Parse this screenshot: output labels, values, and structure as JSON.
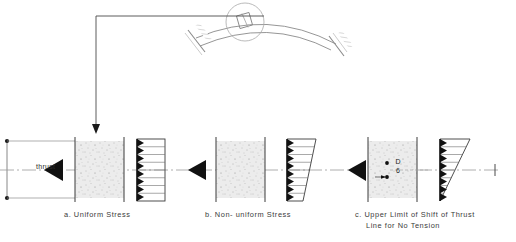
{
  "figure": {
    "title_present": false,
    "background_color": "#ffffff",
    "ink_color": "#2e2e2e",
    "masonry_fill_color": "#e8e8e8",
    "arrow_fill_color": "#111111"
  },
  "arch": {
    "name": "arch-rib-with-abutments",
    "detail_circle_label": "",
    "left_abutment_label": "",
    "right_abutment_label": ""
  },
  "leader": {
    "name": "detail-leader-line",
    "arrow_direction": "down",
    "points_to": "panel-a-section"
  },
  "left_dimension": {
    "name": "section-depth-dimension",
    "label": "",
    "terminator": "dot"
  },
  "panels": [
    {
      "id": "a",
      "caption": "a. Uniform Stress",
      "thrust_label": "thrust",
      "stress_shape": "rectangle",
      "stress_top_value": 1.0,
      "stress_bottom_value": 1.0,
      "arrow_count": 8,
      "has_thrust_label": true,
      "has_eccentricity": false,
      "eccentricity_label": ""
    },
    {
      "id": "b",
      "caption": "b. Non- uniform Stress",
      "thrust_label": "",
      "stress_shape": "trapezoid",
      "stress_top_value": 1.0,
      "stress_bottom_value": 0.45,
      "arrow_count": 8,
      "has_thrust_label": false,
      "has_eccentricity": false,
      "eccentricity_label": ""
    },
    {
      "id": "c",
      "caption_line1": "c. Upper Limit of Shift of Thrust",
      "caption_line2": "Line for No Tension",
      "thrust_label": "",
      "stress_shape": "triangle",
      "stress_top_value": 1.0,
      "stress_bottom_value": 0.0,
      "arrow_count": 8,
      "has_thrust_label": false,
      "has_eccentricity": true,
      "eccentricity_numerator": "D",
      "eccentricity_denominator": "6"
    }
  ],
  "centerline": {
    "name": "horizontal-centerline",
    "style": "dash-dot",
    "end_tick_label": ""
  }
}
